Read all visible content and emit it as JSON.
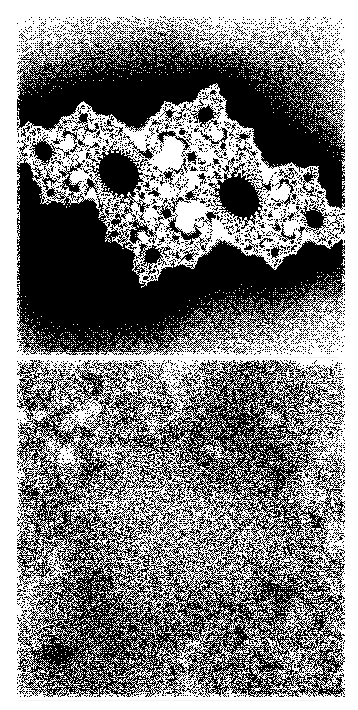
{
  "document": {
    "kind": "scanned-figure-plate",
    "page_width": 358,
    "page_height": 710,
    "background_color": "#ffffff",
    "ink_color": "#000000",
    "rendering": "1-bit dithered halftone scan",
    "caption": ""
  },
  "figure": {
    "title": "",
    "panel_count": 2,
    "layout": "two panels stacked vertically",
    "panels": [
      {
        "id": "panel-top",
        "label": "",
        "kind": "julia-set-fractal",
        "description": "Dendritic Julia set with recursive seahorse-tail spirals; large white escape bays in the upper left and upper centre, dense black filled interior toward the lower left.",
        "x": 17,
        "y": 16,
        "width": 328,
        "height": 339,
        "fill_color": "#000000",
        "background_color": "#ffffff",
        "black_fraction": 0.62,
        "noise_amount": 0.1,
        "render": {
          "type": "julia",
          "cr": -0.74543,
          "ci": 0.11301,
          "center_x": 0.02,
          "center_y": 0.0,
          "scale": 1.35,
          "rotation_deg": -18,
          "max_iter": 160,
          "escape_threshold": 22,
          "dither_strength": 0.14,
          "seed": 20431
        }
      },
      {
        "id": "panel-bottom",
        "label": "",
        "kind": "noisy-fractal-basin",
        "description": "High-frequency salt-and-pepper dithered texture; pale branching filaments cross the upper third, and several dark solid blobs sit in the lower left and lower centre.",
        "x": 17,
        "y": 360,
        "width": 328,
        "height": 337,
        "fill_color": "#000000",
        "background_color": "#ffffff",
        "black_fraction": 0.58,
        "noise_amount": 0.52,
        "render": {
          "type": "noisy-basin",
          "cr": -0.758,
          "ci": 0.108,
          "center_x": 0.0,
          "center_y": 0.0,
          "scale": 0.34,
          "rotation_deg": -18,
          "max_iter": 110,
          "escape_threshold": 20,
          "dither_strength": 0.62,
          "grain_scale": 1.0,
          "seed": 7714
        }
      }
    ]
  },
  "artifacts": {
    "items": [
      {
        "id": "streak-right-edge",
        "kind": "scan-streak",
        "x": 344,
        "y": 88,
        "width": 1,
        "height": 108
      },
      {
        "id": "streak-top-right-dot",
        "kind": "scan-speck",
        "x": 343,
        "y": 50,
        "width": 2,
        "height": 3
      },
      {
        "id": "streak-midgap",
        "kind": "scan-streak",
        "x": 18,
        "y": 357,
        "width": 320,
        "height": 1
      },
      {
        "id": "streak-bottom-gutter",
        "kind": "scan-streak",
        "x": 18,
        "y": 700,
        "width": 300,
        "height": 1
      }
    ]
  }
}
